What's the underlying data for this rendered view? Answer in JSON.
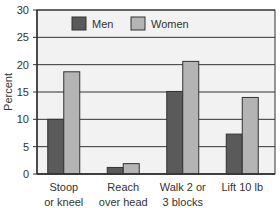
{
  "chart_data": {
    "type": "bar",
    "title": "",
    "xlabel": "",
    "ylabel": "Percent",
    "ylim": [
      0,
      30
    ],
    "yticks": [
      0,
      5,
      10,
      15,
      20,
      25,
      30
    ],
    "grid": true,
    "legend_position": "top-inside",
    "categories": [
      [
        "Stoop",
        "or kneel"
      ],
      [
        "Reach",
        "over head"
      ],
      [
        "Walk 2 or",
        "3 blocks"
      ],
      [
        "Lift 10 lb"
      ]
    ],
    "series": [
      {
        "name": "Men",
        "color": "#5a5a5a",
        "values": [
          10,
          1.2,
          15.1,
          7.3
        ]
      },
      {
        "name": "Women",
        "color": "#b4b4b4",
        "values": [
          18.7,
          1.9,
          20.6,
          14.0
        ]
      }
    ]
  },
  "colors": {
    "plot_background": "#f2f2f2",
    "gridline": "#333333",
    "bar_border": "#333333"
  }
}
